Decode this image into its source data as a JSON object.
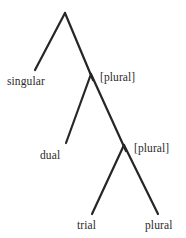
{
  "figure": {
    "type": "feature-tree",
    "colors": {
      "background": "#ffffff",
      "line": "#262626",
      "text": "#2b2b2b"
    },
    "nodes": [
      {
        "id": "root",
        "x": 65,
        "y": 13,
        "label": ""
      },
      {
        "id": "node1",
        "x": 91,
        "y": 76,
        "label": "[plural]"
      },
      {
        "id": "node2",
        "x": 124,
        "y": 147,
        "label": "[plural]"
      }
    ],
    "leaves": [
      {
        "id": "singular",
        "label": "singular",
        "x": 35,
        "y": 70
      },
      {
        "id": "dual",
        "label": "dual",
        "x": 66,
        "y": 143
      },
      {
        "id": "trial",
        "label": "trial",
        "x": 92,
        "y": 214
      },
      {
        "id": "plural",
        "label": "plural",
        "x": 158,
        "y": 214
      }
    ],
    "edges": [
      {
        "from": "root",
        "to": "singular",
        "x1": 65,
        "y1": 13,
        "x2": 35,
        "y2": 70
      },
      {
        "from": "root",
        "to": "node1",
        "x1": 65,
        "y1": 13,
        "x2": 93,
        "y2": 80
      },
      {
        "from": "node1",
        "to": "dual",
        "x1": 91,
        "y1": 74,
        "x2": 66,
        "y2": 143
      },
      {
        "from": "node1",
        "to": "node2",
        "x1": 91,
        "y1": 74,
        "x2": 126,
        "y2": 151
      },
      {
        "from": "node2",
        "to": "trial",
        "x1": 124,
        "y1": 145,
        "x2": 92,
        "y2": 214
      },
      {
        "from": "node2",
        "to": "plural",
        "x1": 124,
        "y1": 145,
        "x2": 158,
        "y2": 214
      }
    ],
    "labels": {
      "singular": "singular",
      "plural_node_1": "[plural]",
      "dual": "dual",
      "plural_node_2": "[plural]",
      "trial": "trial",
      "plural_leaf": "plural"
    }
  }
}
